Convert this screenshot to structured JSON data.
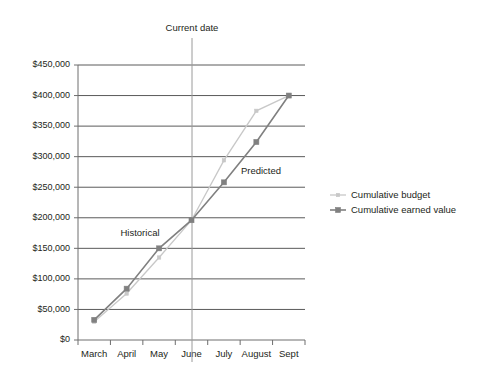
{
  "chart_data": {
    "type": "line",
    "title": "",
    "xlabel": "",
    "ylabel": "",
    "categories": [
      "March",
      "April",
      "May",
      "June",
      "July",
      "August",
      "Sept"
    ],
    "ylim": [
      0,
      450000
    ],
    "ytick_step": 50000,
    "ytick_labels": [
      "$0",
      "$50,000",
      "$100,000",
      "$150,000",
      "$200,000",
      "$250,000",
      "$300,000",
      "$350,000",
      "$400,000",
      "$450,000"
    ],
    "ytick_values": [
      0,
      50000,
      100000,
      150000,
      200000,
      250000,
      300000,
      350000,
      400000,
      450000
    ],
    "grid": "horizontal",
    "legend_position": "right",
    "series": [
      {
        "name": "Cumulative budget",
        "color": "#c8c8c8",
        "marker": "small-square",
        "values": [
          30000,
          76000,
          135000,
          196000,
          294000,
          375000,
          400000
        ]
      },
      {
        "name": "Cumulative earned value",
        "color": "#808080",
        "marker": "square",
        "values": [
          33000,
          84000,
          150000,
          196000,
          258000,
          324000,
          400000
        ]
      }
    ],
    "annotations": [
      {
        "text": "Current date",
        "type": "vertical-reference-line",
        "at_category": "June"
      },
      {
        "text": "Historical",
        "type": "region-label",
        "region": "left-of-current-date"
      },
      {
        "text": "Predicted",
        "type": "region-label",
        "region": "right-of-current-date"
      }
    ],
    "colors": {
      "axis": "#6e6e6e",
      "gridline": "#5a5a5a",
      "reference_line": "#9a9a9a",
      "text": "#231f20",
      "background": "#ffffff"
    }
  }
}
